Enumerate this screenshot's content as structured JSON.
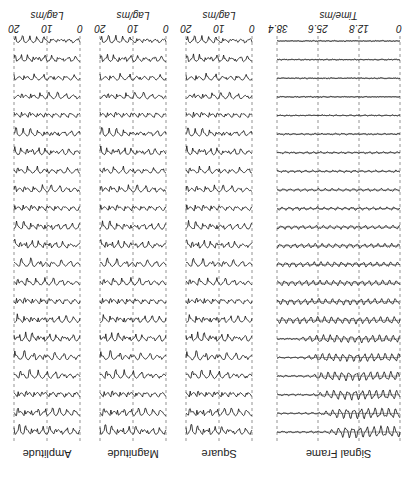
{
  "figure": {
    "orientation": "rotated-180",
    "caption_fragment": "",
    "panels": [
      {
        "id": "signal-frame",
        "title": "Signal Frame",
        "xlabel": "Time/ms",
        "ticks": [
          "0",
          "12.8",
          "25.6",
          "38.4"
        ],
        "tick_values": [
          0,
          12.8,
          25.6,
          38.4
        ],
        "xrange": [
          0,
          38.4
        ]
      },
      {
        "id": "square",
        "title": "Square",
        "xlabel": "Lag/ms",
        "ticks": [
          "0",
          "10",
          "20"
        ],
        "tick_values": [
          0,
          10,
          20
        ],
        "xrange": [
          0,
          20
        ]
      },
      {
        "id": "magnitude",
        "title": "Magnitude",
        "xlabel": "Lag/ms",
        "ticks": [
          "0",
          "10",
          "20"
        ],
        "tick_values": [
          0,
          10,
          20
        ],
        "xrange": [
          0,
          20
        ]
      },
      {
        "id": "amplitude",
        "title": "Amplitude",
        "xlabel": "Lag/ms",
        "ticks": [
          "0",
          "10",
          "20"
        ],
        "tick_values": [
          0,
          10,
          20
        ],
        "xrange": [
          0,
          20
        ]
      }
    ],
    "row_count": 22
  },
  "chart_data": {
    "type": "line",
    "layout": "4 side-by-side panels, each with 22 vertically stacked traces, dashed vertical gridlines at tick positions, image rotated 180 degrees",
    "panels": [
      {
        "name": "Signal Frame",
        "xlabel": "Time/ms",
        "xticks": [
          0,
          12.8,
          25.6,
          38.4
        ],
        "xlim": [
          0,
          38.4
        ],
        "traces": 22,
        "description": "top rows: strong periodic voiced waveform fading out after ~20 ms; lower rows: weaker irregular signal; bottom rows nearly flat"
      },
      {
        "name": "Square",
        "xlabel": "Lag/ms",
        "xticks": [
          0,
          10,
          20
        ],
        "xlim": [
          0,
          20
        ],
        "traces": 22,
        "description": "lag function with periodic dips"
      },
      {
        "name": "Magnitude",
        "xlabel": "Lag/ms",
        "xticks": [
          0,
          10,
          20
        ],
        "xlim": [
          0,
          20
        ],
        "traces": 22,
        "description": "lag function with periodic dips"
      },
      {
        "name": "Amplitude",
        "xlabel": "Lag/ms",
        "xticks": [
          0,
          10,
          20
        ],
        "xlim": [
          0,
          20
        ],
        "traces": 22,
        "description": "lag function with periodic dips"
      }
    ],
    "grid": "dashed vertical lines at ticks",
    "legend": "none"
  }
}
